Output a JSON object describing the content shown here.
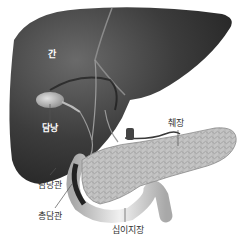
{
  "diagram": {
    "type": "anatomical-illustration",
    "labels": {
      "liver": "간",
      "gallbladder": "담낭",
      "pancreas": "췌장",
      "cystic_duct": "담낭관",
      "common_bile_duct": "총담관",
      "duodenum": "십이지장"
    },
    "colors": {
      "background": "#ffffff",
      "liver_dark": "#2a2a2a",
      "liver_mid": "#4a4a4a",
      "pancreas": "#bdbdbd",
      "duodenum": "#d8d8d8",
      "label_text_dark": "#333333",
      "label_text_light": "#ffffff"
    }
  }
}
